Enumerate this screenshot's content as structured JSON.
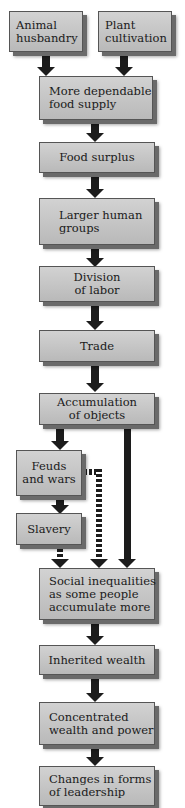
{
  "diagram": {
    "type": "flowchart",
    "nodes": [
      {
        "id": "animal",
        "lines": [
          "Animal",
          "husbandry"
        ]
      },
      {
        "id": "plant",
        "lines": [
          "Plant",
          "cultivation"
        ]
      },
      {
        "id": "food_supply",
        "lines": [
          "More dependable",
          "food supply"
        ]
      },
      {
        "id": "surplus",
        "lines": [
          "Food surplus"
        ]
      },
      {
        "id": "groups",
        "lines": [
          "Larger human",
          "groups"
        ]
      },
      {
        "id": "division",
        "lines": [
          "Division",
          "of labor"
        ]
      },
      {
        "id": "trade",
        "lines": [
          "Trade"
        ]
      },
      {
        "id": "accumulation",
        "lines": [
          "Accumulation",
          "of objects"
        ]
      },
      {
        "id": "feuds",
        "lines": [
          "Feuds",
          "and wars"
        ]
      },
      {
        "id": "slavery",
        "lines": [
          "Slavery"
        ]
      },
      {
        "id": "inequalities",
        "lines": [
          "Social inequalities",
          "as some people",
          "accumulate more"
        ]
      },
      {
        "id": "inherited",
        "lines": [
          "Inherited wealth"
        ]
      },
      {
        "id": "concentrated",
        "lines": [
          "Concentrated",
          "wealth and power"
        ]
      },
      {
        "id": "leadership",
        "lines": [
          "Changes in forms",
          "of leadership"
        ]
      }
    ],
    "edges": [
      {
        "from": "animal",
        "to": "food_supply",
        "style": "solid"
      },
      {
        "from": "plant",
        "to": "food_supply",
        "style": "solid"
      },
      {
        "from": "food_supply",
        "to": "surplus",
        "style": "solid"
      },
      {
        "from": "surplus",
        "to": "groups",
        "style": "solid"
      },
      {
        "from": "groups",
        "to": "division",
        "style": "solid"
      },
      {
        "from": "division",
        "to": "trade",
        "style": "solid"
      },
      {
        "from": "trade",
        "to": "accumulation",
        "style": "solid"
      },
      {
        "from": "accumulation",
        "to": "feuds",
        "style": "solid"
      },
      {
        "from": "accumulation",
        "to": "inequalities",
        "style": "solid"
      },
      {
        "from": "feuds",
        "to": "slavery",
        "style": "solid"
      },
      {
        "from": "feuds",
        "to": "inequalities",
        "style": "dashed"
      },
      {
        "from": "slavery",
        "to": "inequalities",
        "style": "dashed"
      },
      {
        "from": "inequalities",
        "to": "inherited",
        "style": "solid"
      },
      {
        "from": "inherited",
        "to": "concentrated",
        "style": "solid"
      },
      {
        "from": "concentrated",
        "to": "leadership",
        "style": "solid"
      }
    ]
  }
}
